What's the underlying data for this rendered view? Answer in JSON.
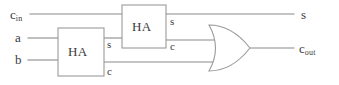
{
  "diagram": {
    "canvas": {
      "width": 339,
      "height": 85,
      "background": "#ffffff"
    },
    "style": {
      "line_color": "#8a8a8a",
      "box_stroke": "#9a9a9a",
      "text_color": "#3a3a3a",
      "fill": "#ffffff"
    },
    "inputs": [
      {
        "id": "cin",
        "base": "c",
        "sub": "in",
        "x": 10,
        "y": 8,
        "wire_y": 14
      },
      {
        "id": "a",
        "base": "a",
        "sub": "",
        "x": 15,
        "y": 31,
        "wire_y": 38
      },
      {
        "id": "b",
        "base": "b",
        "sub": "",
        "x": 15,
        "y": 53,
        "wire_y": 60
      }
    ],
    "blocks": [
      {
        "id": "ha1",
        "label": "HA",
        "x": 58,
        "y": 28,
        "w": 46,
        "h": 48
      },
      {
        "id": "ha2",
        "label": "HA",
        "x": 122,
        "y": 5,
        "w": 44,
        "h": 43
      }
    ],
    "gate": {
      "id": "or1",
      "type": "OR",
      "label": "",
      "x": 208,
      "y": 25,
      "w": 42,
      "h": 47
    },
    "pin_labels": [
      {
        "id": "ha1-s",
        "text": "s",
        "x": 107,
        "y": 39
      },
      {
        "id": "ha1-c",
        "text": "c",
        "x": 107,
        "y": 66
      },
      {
        "id": "ha2-s",
        "text": "s",
        "x": 170,
        "y": 16
      },
      {
        "id": "ha2-c",
        "text": "c",
        "x": 170,
        "y": 41
      }
    ],
    "outputs": [
      {
        "id": "sum",
        "base": "s",
        "sub": "",
        "x": 301,
        "y": 8,
        "wire_y": 14
      },
      {
        "id": "cout",
        "base": "c",
        "sub": "out",
        "x": 299,
        "y": 42,
        "wire_y": 48
      }
    ],
    "connections": [
      {
        "id": "cin-to-ha2",
        "from": "cin",
        "to": "ha2.in1"
      },
      {
        "id": "a-to-ha1",
        "from": "a",
        "to": "ha1.in1"
      },
      {
        "id": "b-to-ha1",
        "from": "b",
        "to": "ha1.in2"
      },
      {
        "id": "ha1s-to-ha2",
        "from": "ha1.s",
        "to": "ha2.in2"
      },
      {
        "id": "ha1c-to-or",
        "from": "ha1.c",
        "to": "or1.in2"
      },
      {
        "id": "ha2s-to-sum",
        "from": "ha2.s",
        "to": "sum"
      },
      {
        "id": "ha2c-to-or",
        "from": "ha2.c",
        "to": "or1.in1"
      },
      {
        "id": "or-to-cout",
        "from": "or1.out",
        "to": "cout"
      }
    ]
  }
}
